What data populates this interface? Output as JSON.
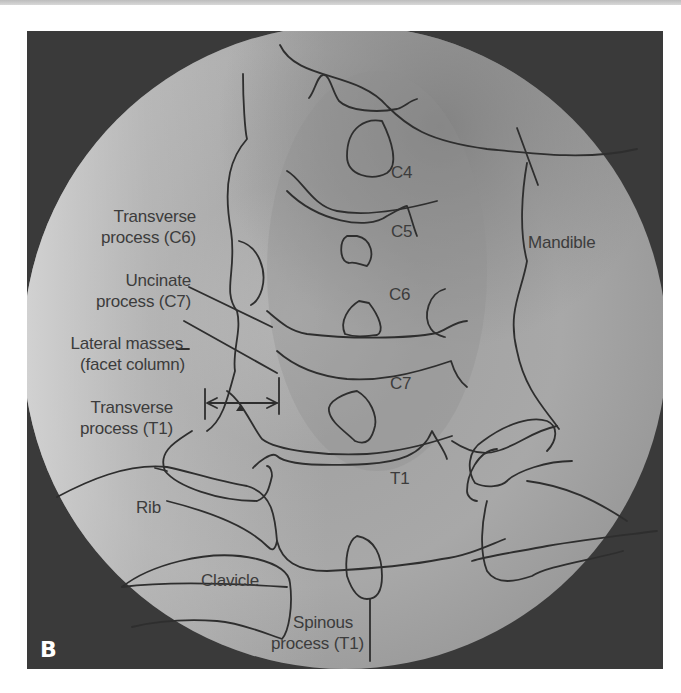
{
  "figure": {
    "panel_letter": "B",
    "type": "Annotated AP radiograph of the cervicothoracic spine (swimmer's/fluoroscopic circular view)",
    "colors": {
      "frame_background": "#3a3a3a",
      "field_light": "#c9c9c9",
      "field_mid": "#9c9c9c",
      "outline": "#2e2e2e",
      "label_text": "#3c3c3c",
      "panel_letter": "#ffffff"
    }
  },
  "labels": {
    "c4": "C4",
    "c5": "C5",
    "c6": "C6",
    "c7": "C7",
    "t1": "T1",
    "mandible": "Mandible",
    "transverse_c6_line1": "Transverse",
    "transverse_c6_line2": "process (C6)",
    "uncinate_line1": "Uncinate",
    "uncinate_line2": "process (C7)",
    "lateral_masses_line1": "Lateral masses",
    "lateral_masses_line2": "(facet column)",
    "transverse_t1_line1": "Transverse",
    "transverse_t1_line2": "process (T1)",
    "rib": "Rib",
    "clavicle": "Clavicle",
    "spinous_line1": "Spinous",
    "spinous_line2": "process (T1)"
  },
  "annotations": {
    "measurement_arrow": "double-headed arrow spanning lateral mass width with arrowhead marker"
  }
}
